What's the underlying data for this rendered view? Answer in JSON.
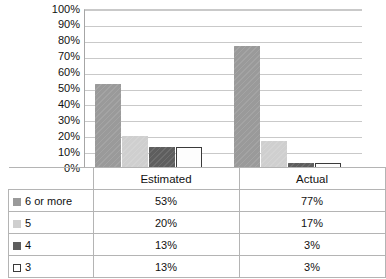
{
  "chart_data": {
    "type": "bar",
    "title": "",
    "subtitle": "",
    "xlabel": "",
    "ylabel": "",
    "categories": [
      "Estimated",
      "Actual"
    ],
    "series": [
      {
        "name": "6 or more",
        "values": [
          53,
          77
        ],
        "labels": [
          "53%",
          "77%"
        ],
        "color": "#9a9a9a",
        "swatch": "filled-medium-gray"
      },
      {
        "name": "5",
        "values": [
          20,
          17
        ],
        "labels": [
          "20%",
          "17%"
        ],
        "color": "#cfcfcf",
        "swatch": "filled-light-gray"
      },
      {
        "name": "4",
        "values": [
          13,
          3
        ],
        "labels": [
          "13%",
          "3%"
        ],
        "color": "#5e5e5e",
        "swatch": "filled-dark-gray"
      },
      {
        "name": "3",
        "values": [
          13,
          3
        ],
        "labels": [
          "13%",
          "3%"
        ],
        "color": "#ffffff",
        "swatch": "outlined-white"
      }
    ],
    "ylim": [
      0,
      100
    ],
    "ytick_values": [
      0,
      10,
      20,
      30,
      40,
      50,
      60,
      70,
      80,
      90,
      100
    ],
    "ytick_labels": [
      "0%",
      "10%",
      "20%",
      "30%",
      "40%",
      "50%",
      "60%",
      "70%",
      "80%",
      "90%",
      "100%"
    ],
    "grid": true,
    "grid_axis": "y",
    "legend_position": "data-table",
    "units": "percent",
    "has_data_table": true
  },
  "table": {
    "header": {
      "blank": "",
      "columns": [
        "Estimated",
        "Actual"
      ]
    },
    "rows": [
      {
        "key": "6 or more",
        "values": [
          "53%",
          "77%"
        ]
      },
      {
        "key": "5",
        "values": [
          "20%",
          "17%"
        ]
      },
      {
        "key": "4",
        "values": [
          "13%",
          "3%"
        ]
      },
      {
        "key": "3",
        "values": [
          "13%",
          "3%"
        ]
      }
    ]
  },
  "colors": {
    "series_6_or_more": "#9a9a9a",
    "series_5": "#cfcfcf",
    "series_4": "#5e5e5e",
    "series_3": "#ffffff",
    "gridline": "#c9c9c9",
    "axis": "#a6a6a6",
    "table_border": "#b4b4b4",
    "text": "#111111",
    "background": "#ffffff"
  }
}
